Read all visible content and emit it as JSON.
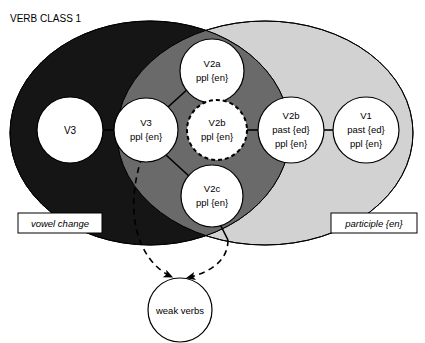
{
  "diagram": {
    "title": "VERB CLASS 1",
    "colors": {
      "vowel_change_fill": "#151515",
      "overlap_fill": "#6a6a6a",
      "participle_fill": "#d2d2d2",
      "node_fill": "#ffffff",
      "stroke": "#000000",
      "background": "#ffffff"
    },
    "regions": [
      {
        "id": "vowel-change",
        "label": "vowel change",
        "fill": "#151515",
        "cx": 150,
        "cy": 133,
        "rx": 140,
        "ry": 112
      },
      {
        "id": "participle-en",
        "label": "participle {en}",
        "fill": "#d2d2d2",
        "cx": 265,
        "cy": 133,
        "rx": 148,
        "ry": 112
      }
    ],
    "nodes": [
      {
        "id": "v3-strong",
        "lines": [
          "V3"
        ],
        "cx": 70,
        "cy": 130,
        "r": 33,
        "dashed": false
      },
      {
        "id": "v3-ppl",
        "lines": [
          "V3",
          "ppl {en}"
        ],
        "cx": 146,
        "cy": 130,
        "r": 32,
        "dashed": false
      },
      {
        "id": "v2a-ppl",
        "lines": [
          "V2a",
          "ppl {en}"
        ],
        "cx": 212,
        "cy": 71,
        "r": 32,
        "dashed": false
      },
      {
        "id": "v2b-ppl",
        "lines": [
          "V2b",
          "ppl {en}"
        ],
        "cx": 217,
        "cy": 130,
        "r": 30,
        "dashed": true
      },
      {
        "id": "v2b-past-ppl",
        "lines": [
          "V2b",
          "past {ed}",
          "ppl {en}"
        ],
        "cx": 291,
        "cy": 130,
        "r": 33,
        "dashed": false
      },
      {
        "id": "v1-past-ppl",
        "lines": [
          "V1",
          "past {ed}",
          "ppl {en}"
        ],
        "cx": 366,
        "cy": 130,
        "r": 33,
        "dashed": false
      },
      {
        "id": "v2c-ppl",
        "lines": [
          "V2c",
          "ppl {en}"
        ],
        "cx": 212,
        "cy": 196,
        "r": 31,
        "dashed": false
      },
      {
        "id": "weak-verbs",
        "lines": [
          "weak verbs"
        ],
        "cx": 180,
        "cy": 310,
        "r": 32,
        "dashed": false
      }
    ],
    "box_labels": [
      {
        "id": "vowel-change-label",
        "text": "vowel change",
        "x": 18,
        "y": 213,
        "width": 84,
        "height": 20
      },
      {
        "id": "participle-label",
        "text": "participle {en}",
        "x": 331,
        "y": 213,
        "width": 86,
        "height": 20
      }
    ],
    "connectors": [
      {
        "id": "v3-to-v3ppl",
        "from": "v3-strong",
        "to": "v3-ppl"
      },
      {
        "id": "v3ppl-to-v2a",
        "from": "v3-ppl",
        "to": "v2a-ppl"
      },
      {
        "id": "v2a-to-v2b",
        "from": "v2a-ppl",
        "to": "v2b-ppl"
      },
      {
        "id": "v2b-to-v2bpast",
        "from": "v2b-ppl",
        "to": "v2b-past-ppl"
      },
      {
        "id": "v2bpast-to-v1",
        "from": "v2b-past-ppl",
        "to": "v1-past-ppl"
      },
      {
        "id": "v3ppl-to-v2c",
        "from": "v3-ppl",
        "to": "v2c-ppl"
      },
      {
        "id": "v2c-down",
        "from": "v2c-ppl",
        "to": "region-edge"
      }
    ],
    "arrows": [
      {
        "id": "arrow-left-to-weak",
        "style": "dashed",
        "target": "weak-verbs"
      },
      {
        "id": "arrow-right-to-weak",
        "style": "dashed",
        "target": "weak-verbs"
      }
    ]
  }
}
